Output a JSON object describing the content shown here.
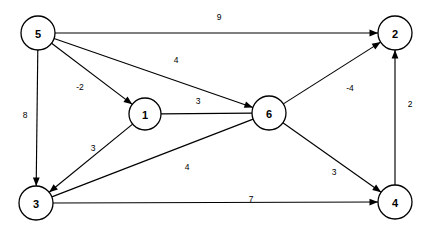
{
  "diagram": {
    "type": "node-link-graph",
    "width": 437,
    "height": 239,
    "background_color": "#ffffff",
    "stroke_color": "#000000",
    "node_fill_color": "#ffffff",
    "nodes": [
      {
        "id": "5",
        "label": "5",
        "cx": 38,
        "cy": 33,
        "r": 17
      },
      {
        "id": "2",
        "label": "2",
        "cx": 395,
        "cy": 33,
        "r": 17
      },
      {
        "id": "1",
        "label": "1",
        "cx": 145,
        "cy": 114,
        "r": 16
      },
      {
        "id": "6",
        "label": "6",
        "cx": 269,
        "cy": 113,
        "r": 17
      },
      {
        "id": "3",
        "label": "3",
        "cx": 36,
        "cy": 203,
        "r": 17
      },
      {
        "id": "4",
        "label": "4",
        "cx": 395,
        "cy": 202,
        "r": 17
      }
    ],
    "edges": [
      {
        "id": "e-5-2",
        "from": "5",
        "to": "2",
        "weight": "9",
        "directed": true,
        "label_x": 219,
        "label_y": 17
      },
      {
        "id": "e-5-6",
        "from": "5",
        "to": "6",
        "weight": "4",
        "directed": true,
        "label_x": 176,
        "label_y": 60
      },
      {
        "id": "e-5-1",
        "from": "5",
        "to": "1",
        "weight": "-2",
        "directed": true,
        "label_x": 80,
        "label_y": 87
      },
      {
        "id": "e-5-3",
        "from": "5",
        "to": "3",
        "weight": "8",
        "directed": true,
        "label_x": 25,
        "label_y": 115
      },
      {
        "id": "e-1-6",
        "from": "1",
        "to": "6",
        "weight": "3",
        "directed": false,
        "label_x": 198,
        "label_y": 101
      },
      {
        "id": "e-1-3",
        "from": "1",
        "to": "3",
        "weight": "3",
        "directed": true,
        "label_x": 93,
        "label_y": 148
      },
      {
        "id": "e-3-6",
        "from": "3",
        "to": "6",
        "weight": "4",
        "directed": false,
        "label_x": 187,
        "label_y": 167
      },
      {
        "id": "e-6-2",
        "from": "6",
        "to": "2",
        "weight": "-4",
        "directed": true,
        "label_x": 350,
        "label_y": 88
      },
      {
        "id": "e-6-4",
        "from": "6",
        "to": "4",
        "weight": "3",
        "directed": true,
        "label_x": 334,
        "label_y": 172
      },
      {
        "id": "e-3-4",
        "from": "3",
        "to": "4",
        "weight": "7",
        "directed": true,
        "label_x": 251,
        "label_y": 199
      },
      {
        "id": "e-4-2",
        "from": "4",
        "to": "2",
        "weight": "2",
        "directed": true,
        "label_x": 410,
        "label_y": 104
      }
    ]
  }
}
